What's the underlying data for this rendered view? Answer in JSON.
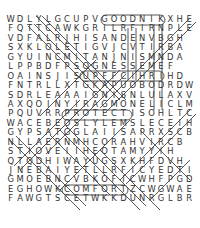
{
  "puzzle": {
    "type": "word-search",
    "rows": [
      "WDLYLGCUPVGOODNIKXHE",
      "FQTTCAWKGRILRFIRNPLE",
      "VDFALRJHISANDENVBGH ",
      "SXKLOLETIGVJCVTIRBA ",
      "GYUINCMITANJNISMNDA ",
      "LPPBDFPSOGNESSEMEF  ",
      "OAINSJISUPFFCIHRIHD ",
      "FNTRLLXTGKAPUOBODRDW",
      "SDRLEAAAIGNISNLULAXV",
      "AXQOINYIRAGMONELICLM",
      "PQUVRRPROTECTISOHLTC",
      "WACEBEOSLYLEMSLECEIH",
      "GYPSATGGLAIISAPRXSCB",
      "NLLAERNMHCORAHVIRCB ",
      "STIOVEIIHEOTAMYYIH  ",
      "QTQDHIWAYUGSXKHFDVH ",
      "JNEBAIYETLLRFICYEDTI",
      "GMOEBNCVBKOFICWHFPGD",
      "EGHOWKCOMFORTZCWGWAE",
      "FAWGTSCETWKKDUNRGLBR"
    ],
    "found_words_visible": [
      "GOODNIK",
      "PROTECT",
      "COMFORT",
      "SOGNESSEME"
    ]
  }
}
